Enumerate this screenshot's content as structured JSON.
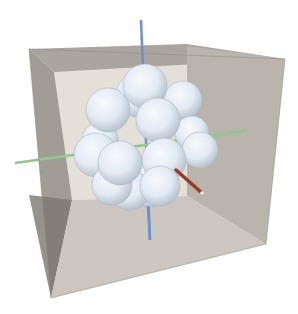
{
  "scene": {
    "description": "3D render of a cluster of white spheres inside a translucent gray box with XYZ axes",
    "background": "#ffffff",
    "box": {
      "back_face": "#e2ded6",
      "left_face": "#9c978f",
      "right_face": "#b8b3ab",
      "top_face": "#a9a49c",
      "bottom_face": "#c9c5be",
      "edge": "#8a857d"
    },
    "axes": {
      "x_color": "#8fc98a",
      "y_color": "#6b8fd0",
      "z_color": "#9a3a28"
    },
    "sphere_color": "#e4ecf4",
    "sphere_count": 19
  }
}
